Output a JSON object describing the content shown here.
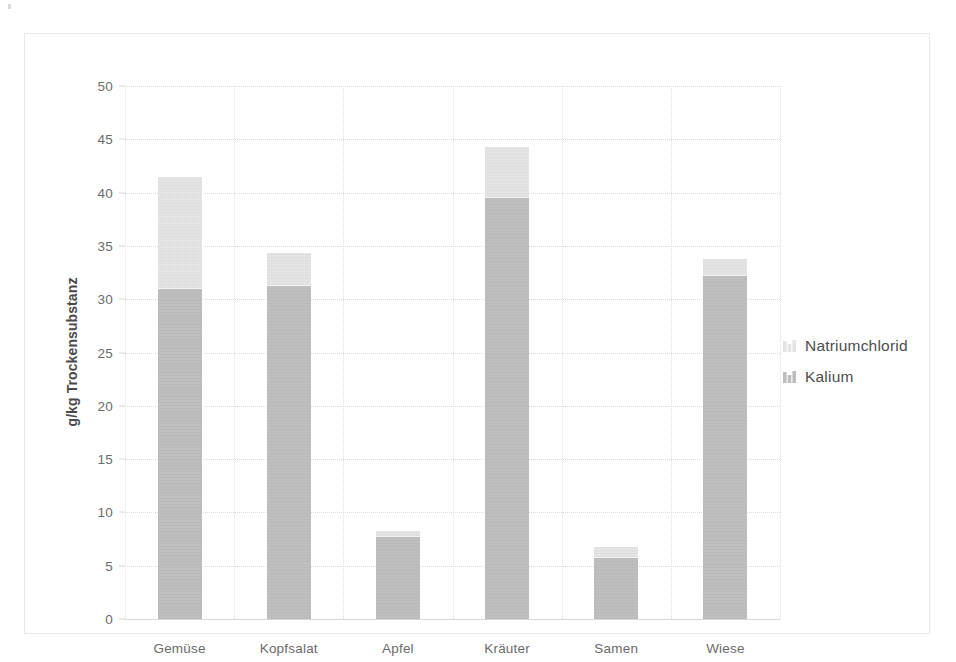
{
  "chart_data": {
    "type": "bar",
    "subtype": "stacked-bar",
    "title": "",
    "xlabel": "",
    "ylabel": "g/kg Trockensubstanz",
    "ylim": [
      0,
      50
    ],
    "ytick_step": 5,
    "yticks": [
      0,
      5,
      10,
      15,
      20,
      25,
      30,
      35,
      40,
      45,
      50
    ],
    "ytick_labels": [
      "0",
      "5",
      "10",
      "15",
      "20",
      "25",
      "30",
      "35",
      "40",
      "45",
      "50"
    ],
    "categories": [
      "Gemüse",
      "Kopfsalat",
      "Apfel",
      "Kräuter",
      "Samen",
      "Wiese"
    ],
    "series": [
      {
        "name": "Kalium",
        "color": "#bdbdbd",
        "values": [
          31.0,
          31.2,
          7.7,
          39.5,
          5.7,
          32.2
        ]
      },
      {
        "name": "Natriumchlorid",
        "color": "#e4e4e4",
        "values": [
          10.5,
          3.1,
          0.6,
          4.8,
          1.1,
          1.6
        ]
      }
    ],
    "totals": [
      41.5,
      34.3,
      8.3,
      44.3,
      6.8,
      33.8
    ],
    "stack_order": [
      "Kalium",
      "Natriumchlorid"
    ],
    "grid": true,
    "grid_axis": "both",
    "legend": true,
    "legend_position": "right",
    "legend_entries": [
      {
        "label": "Natriumchlorid",
        "color": "#e4e4e4",
        "icon": "bar-swatch-icon"
      },
      {
        "label": "Kalium",
        "color": "#bdbdbd",
        "icon": "bar-swatch-icon"
      }
    ],
    "colors": {
      "natriumchlorid": "#e4e4e4",
      "kalium": "#bdbdbd",
      "gridline": "#dcdcdc",
      "axis_text": "#6b6b6b",
      "frame": "#e8e8e8"
    }
  }
}
